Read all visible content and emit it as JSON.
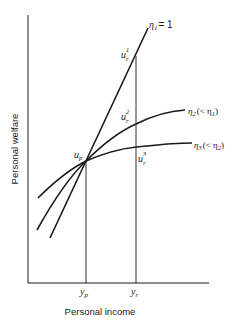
{
  "diagram": {
    "axes": {
      "y_label": "Personal welfare",
      "x_label": "Personal income"
    },
    "x_ticks": [
      {
        "base": "y",
        "sub": "p"
      },
      {
        "base": "y",
        "sub": "r"
      }
    ],
    "points": {
      "up": {
        "base": "u",
        "sub": "p"
      },
      "ur1": {
        "base": "u",
        "sub": "r",
        "sup": "1"
      },
      "ur2": {
        "base": "u",
        "sub": "r",
        "sup": "2"
      },
      "ur3": {
        "base": "u",
        "sub": "r",
        "sup": "3"
      }
    },
    "curves": [
      {
        "name": "eta1",
        "base": "η",
        "sub": "1",
        "suffix": "= 1"
      },
      {
        "name": "eta2",
        "base": "η",
        "sub": "2",
        "suffix": "(< η",
        "suffix_sub": "1",
        "close": ")"
      },
      {
        "name": "eta3",
        "base": "η",
        "sub": "3",
        "suffix": "(< η",
        "suffix_sub": "2",
        "close": ")"
      }
    ],
    "colors": {
      "ink": "#1a1a1a",
      "background": "#ffffff"
    }
  }
}
